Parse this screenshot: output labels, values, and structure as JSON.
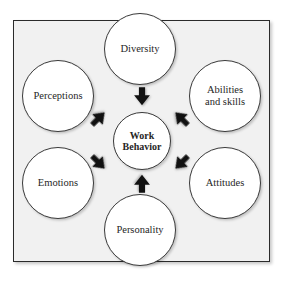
{
  "diagram": {
    "center": {
      "id": "work-behavior",
      "line1": "Work",
      "line2": "Behavior"
    },
    "nodes": [
      {
        "id": "diversity",
        "line1": "Diversity",
        "line2": ""
      },
      {
        "id": "perceptions",
        "line1": "Perceptions",
        "line2": ""
      },
      {
        "id": "abilities",
        "line1": "Abilities",
        "line2": "and skills"
      },
      {
        "id": "emotions",
        "line1": "Emotions",
        "line2": ""
      },
      {
        "id": "attitudes",
        "line1": "Attitudes",
        "line2": ""
      },
      {
        "id": "personality",
        "line1": "Personality",
        "line2": ""
      }
    ],
    "arrows": [
      {
        "id": "arrow-diversity-to-center",
        "direction": "down"
      },
      {
        "id": "arrow-perceptions-to-center",
        "direction": "down-right"
      },
      {
        "id": "arrow-abilities-to-center",
        "direction": "down-left"
      },
      {
        "id": "arrow-emotions-to-center",
        "direction": "up-right"
      },
      {
        "id": "arrow-attitudes-to-center",
        "direction": "up-left"
      },
      {
        "id": "arrow-personality-to-center",
        "direction": "up"
      }
    ],
    "colors": {
      "panel_background": "#f1f1f1",
      "panel_border": "#2b2b2b",
      "circle_fill": "#ffffff",
      "circle_border": "#3a3a3a",
      "arrow_fill": "#111111",
      "text": "#262626"
    }
  }
}
